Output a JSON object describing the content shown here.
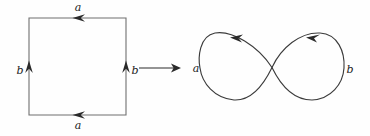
{
  "figure": {
    "stroke_color": "#3b3b3b",
    "label_color": "#1b1b1b",
    "background_color": "#fefefe"
  },
  "square": {
    "name": "identified-square",
    "edges": {
      "top": {
        "label": "a",
        "arrow_direction": "left"
      },
      "bottom": {
        "label": "a",
        "arrow_direction": "left"
      },
      "left": {
        "label": "b",
        "arrow_direction": "up"
      },
      "right": {
        "label": "b",
        "arrow_direction": "up"
      }
    }
  },
  "map_arrow": {
    "name": "quotient-map-arrow",
    "direction": "right",
    "label": ""
  },
  "figure_eight": {
    "name": "wedge-of-two-circles",
    "loops": {
      "left": {
        "label": "a",
        "arrow_direction": "left"
      },
      "right": {
        "label": "b",
        "arrow_direction": "right"
      }
    }
  }
}
